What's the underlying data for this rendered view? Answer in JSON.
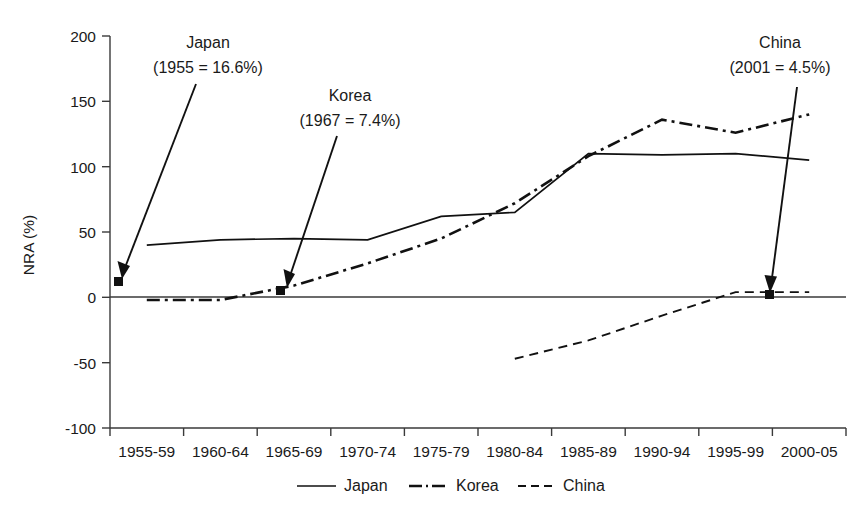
{
  "chart_data": {
    "type": "line",
    "title": "",
    "xlabel": "",
    "ylabel": "NRA (%)",
    "ylim": [
      -100,
      200
    ],
    "ytick_values": [
      200,
      150,
      100,
      50,
      0,
      -50,
      -100
    ],
    "ytick_labels": [
      "200",
      "150",
      "100",
      "50",
      "0",
      "-50",
      "-100"
    ],
    "grid": false,
    "legend_position": "bottom-center",
    "categories": [
      "1955-59",
      "1960-64",
      "1965-69",
      "1970-74",
      "1975-79",
      "1980-84",
      "1985-89",
      "1990-94",
      "1995-99",
      "2000-05"
    ],
    "series": [
      {
        "name": "Japan",
        "style": "solid",
        "values": [
          40,
          44,
          45,
          44,
          62,
          65,
          110,
          109,
          110,
          105
        ]
      },
      {
        "name": "Korea",
        "style": "dash-dot",
        "values": [
          -2,
          -2,
          9,
          26,
          45,
          72,
          108,
          136,
          126,
          140
        ]
      },
      {
        "name": "China",
        "style": "dashed",
        "values": [
          null,
          null,
          null,
          null,
          null,
          -47,
          -33,
          -14,
          4,
          4
        ]
      }
    ],
    "annotations": [
      {
        "id": "japan-annotation",
        "title": "Japan",
        "detail": "(1955 = 16.6%)",
        "point_label": "16.6",
        "point_value": 16.6,
        "point_category": "1955"
      },
      {
        "id": "korea-annotation",
        "title": "Korea",
        "detail": "(1967 = 7.4%)",
        "point_label": "7.4",
        "point_value": 7.4,
        "point_category": "1967"
      },
      {
        "id": "china-annotation",
        "title": "China",
        "detail": "(2001 = 4.5%)",
        "point_label": "4.5",
        "point_value": 4.5,
        "point_category": "2001"
      }
    ],
    "legend": [
      {
        "label": "Japan",
        "style": "solid"
      },
      {
        "label": "Korea",
        "style": "dash-dot"
      },
      {
        "label": "China",
        "style": "dashed"
      }
    ]
  }
}
